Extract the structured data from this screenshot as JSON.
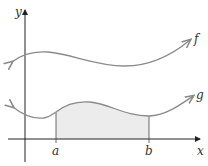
{
  "figure": {
    "axes": {
      "x_label": "x",
      "y_label": "y"
    },
    "curves": [
      {
        "name": "f",
        "label": "f",
        "color": "#8a8a8a"
      },
      {
        "name": "g",
        "label": "g",
        "color": "#8a8a8a"
      }
    ],
    "markers": {
      "a_label": "a",
      "b_label": "b"
    },
    "shaded_region": {
      "from": "a",
      "to": "b",
      "under": "g",
      "color": "#ececec"
    }
  }
}
